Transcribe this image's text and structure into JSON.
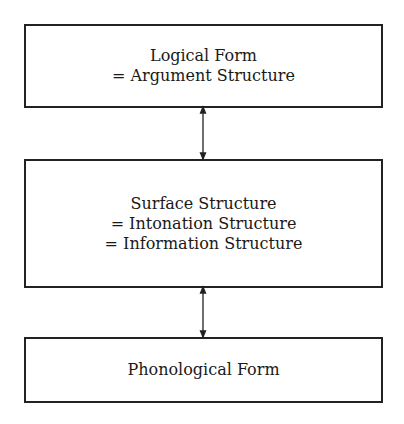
{
  "diagram": {
    "nodes": [
      {
        "id": "logical-form",
        "lines": [
          "Logical Form",
          "= Argument Structure"
        ]
      },
      {
        "id": "surface-structure",
        "lines": [
          "Surface Structure",
          "= Intonation Structure",
          "= Information Structure"
        ]
      },
      {
        "id": "phonological-form",
        "lines": [
          "Phonological Form"
        ]
      }
    ],
    "edges": [
      {
        "from": "logical-form",
        "to": "surface-structure",
        "type": "bidirectional"
      },
      {
        "from": "surface-structure",
        "to": "phonological-form",
        "type": "bidirectional"
      }
    ]
  }
}
